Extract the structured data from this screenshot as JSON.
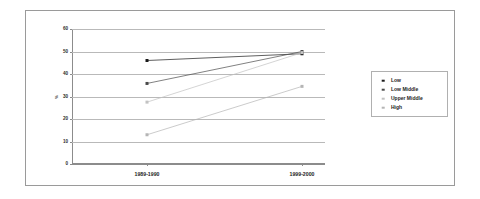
{
  "chart_data": {
    "type": "line",
    "title": "",
    "xlabel": "",
    "ylabel": "%",
    "categories": [
      "1989-1990",
      "1999-2000"
    ],
    "ylim": [
      0,
      60
    ],
    "yticks": [
      0,
      10,
      20,
      30,
      40,
      50,
      60
    ],
    "ytick_labels": [
      "0",
      "10",
      "20",
      "30",
      "40",
      "50",
      "60"
    ],
    "grid": true,
    "legend_position": "right",
    "series": [
      {
        "name": "Low",
        "values": [
          46,
          49
        ],
        "color": "#1a1a1a",
        "marker": "square"
      },
      {
        "name": "Low Middle",
        "values": [
          35.8,
          50
        ],
        "color": "#4a4a4a",
        "marker": "square"
      },
      {
        "name": "Upper Middle",
        "values": [
          27.5,
          49.5
        ],
        "color": "#c2c2c2",
        "marker": "square"
      },
      {
        "name": "High",
        "values": [
          13,
          34.5
        ],
        "color": "#b5b5b5",
        "marker": "square"
      }
    ]
  },
  "legend": {
    "items": [
      {
        "label": "Low"
      },
      {
        "label": "Low Middle"
      },
      {
        "label": "Upper Middle"
      },
      {
        "label": "High"
      }
    ]
  },
  "colors": {
    "frame_border": "#9a9a9a",
    "axis": "#8c8c8c",
    "gridline": "#b9b9b9",
    "background": "#ffffff"
  }
}
